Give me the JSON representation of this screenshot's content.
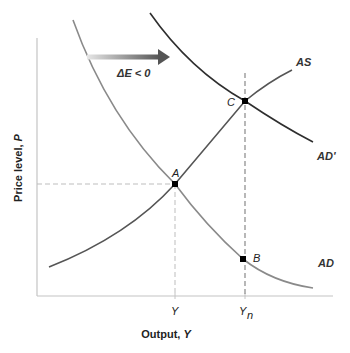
{
  "diagram": {
    "type": "AD-AS shift diagram",
    "axes": {
      "x_label_prefix": "Output, ",
      "x_label_var": "Y",
      "y_label_prefix": "Price level, ",
      "y_label_var": "P",
      "x_ticks": [
        {
          "label": "Y",
          "sub": ""
        },
        {
          "label": "Y",
          "sub": "n"
        }
      ]
    },
    "curves": [
      {
        "name": "AS",
        "label": "AS",
        "color": "#555555"
      },
      {
        "name": "AD",
        "label": "AD",
        "color": "#8a8a8a"
      },
      {
        "name": "AD'",
        "label": "AD'",
        "color": "#2e2e2e"
      }
    ],
    "points": [
      {
        "label": "A"
      },
      {
        "label": "B"
      },
      {
        "label": "C"
      }
    ],
    "shift_arrow": {
      "label": "ΔE < 0",
      "direction": "right",
      "color": "#555555"
    },
    "colors": {
      "axis": "#bdbdbd",
      "guide_dashes": "#bdbdbd",
      "yn_dashes": "#999999",
      "points": "#000000"
    }
  }
}
